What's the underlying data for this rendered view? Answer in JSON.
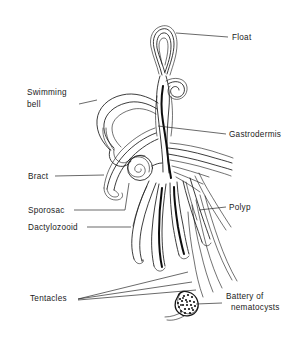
{
  "figure": {
    "style": "black and white line drawing",
    "background_color": "#ffffff",
    "line_color": "#1a1a1a"
  },
  "labels": [
    {
      "id": "float",
      "text": "Float",
      "text2": "",
      "side": "right",
      "x": 232,
      "y": 40,
      "leader_from_x": 228,
      "leader_from_y": 37,
      "leader_to_x": 176,
      "leader_to_y": 33
    },
    {
      "id": "swimming-bell",
      "text": "Swimming",
      "text2": "bell",
      "side": "left",
      "x": 27,
      "y": 95,
      "leader_from_x": 79,
      "leader_from_y": 104,
      "leader_to_x": 97,
      "leader_to_y": 100
    },
    {
      "id": "gastrodermis",
      "text": "Gastrodermis",
      "text2": "",
      "side": "right",
      "x": 229,
      "y": 137,
      "leader_from_x": 226,
      "leader_from_y": 134,
      "leader_to_x": 158,
      "leader_to_y": 126
    },
    {
      "id": "bract",
      "text": "Bract",
      "text2": "",
      "side": "left",
      "x": 28,
      "y": 179,
      "leader_from_x": 55,
      "leader_from_y": 176,
      "leader_to_x": 104,
      "leader_to_y": 175
    },
    {
      "id": "sporosac",
      "text": "Sporosac",
      "text2": "",
      "side": "left",
      "x": 28,
      "y": 213,
      "leader_from_x": 74,
      "leader_from_y": 210,
      "leader_to_x": 125,
      "leader_to_y": 182
    },
    {
      "id": "dactylozooid",
      "text": "Dactylozooid",
      "text2": "",
      "side": "left",
      "x": 28,
      "y": 230,
      "leader_from_x": 87,
      "leader_from_y": 227,
      "leader_to_x": 131,
      "leader_to_y": 227
    },
    {
      "id": "polyp",
      "text": "Polyp",
      "text2": "",
      "side": "right",
      "x": 229,
      "y": 210,
      "leader_from_x": 226,
      "leader_from_y": 207,
      "leader_to_x": 199,
      "leader_to_y": 210
    },
    {
      "id": "tentacles",
      "text": "Tentacles",
      "text2": "",
      "side": "left",
      "x": 30,
      "y": 301,
      "leader_from_x": 78,
      "leader_from_y": 299,
      "leader_to_x": 185,
      "leader_to_y": 276
    },
    {
      "id": "battery-of-nematocysts",
      "text": "Battery of",
      "text2": "nematocysts",
      "side": "right",
      "x": 226,
      "y": 299,
      "leader_from_x": 222,
      "leader_from_y": 303,
      "leader_to_x": 196,
      "leader_to_y": 304
    }
  ],
  "parts": [
    {
      "id": "float",
      "name": "Float",
      "description": "elongated gas-filled pneumatophore at the apex of the colony"
    },
    {
      "id": "swimming-bell",
      "name": "Swimming bell",
      "description": "nectophore, the hooked propulsive bell on the upper left of the stem"
    },
    {
      "id": "gastrodermis",
      "name": "Gastrodermis",
      "description": "dark inner lining of the central stem and stolon"
    },
    {
      "id": "bract",
      "name": "Bract",
      "description": "leaf-like protective scale on the left of the stem"
    },
    {
      "id": "sporosac",
      "name": "Sporosac",
      "description": "coiled spiral reproductive body attached to the stem"
    },
    {
      "id": "dactylozooid",
      "name": "Dactylozooid",
      "description": "slender defensive zooid hanging from the stem"
    },
    {
      "id": "polyp",
      "name": "Polyp",
      "description": "feeding gastrozooid on the right of the cluster"
    },
    {
      "id": "tentacles",
      "name": "Tentacles",
      "description": "long fine trailing tentacles extending down and to the right"
    },
    {
      "id": "battery",
      "name": "Battery of nematocysts",
      "description": "dark stippled cluster of stinging cells on a tentacle"
    }
  ]
}
